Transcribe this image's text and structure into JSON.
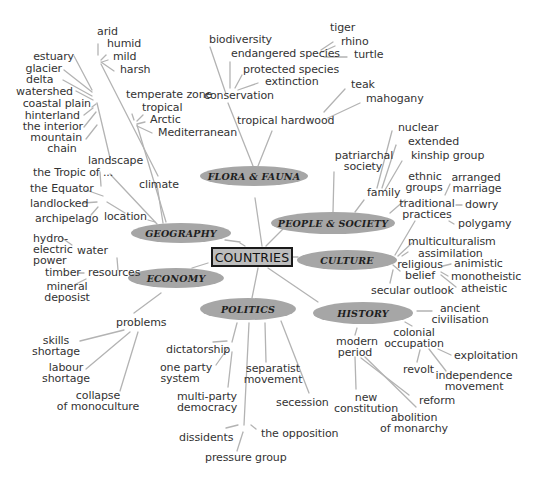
{
  "diagram": {
    "type": "mind-map",
    "center": "COUNTRIES",
    "colors": {
      "oval_fill": "#a6a6a6",
      "center_fill": "#bdbdbd",
      "center_border": "#1a1a1a",
      "connector": "#b3b3b3",
      "text": "#333333"
    },
    "branches": {
      "flora_fauna": {
        "label": "FLORA & FAUNA",
        "conservation": "conservation",
        "biodiversity": "biodiversity",
        "endangered_species": "endangered species",
        "tiger": "tiger",
        "rhino": "rhino",
        "turtle": "turtle",
        "protected_species": "protected species",
        "extinction": "extinction",
        "tropical_hardwood": "tropical hardwood",
        "teak": "teak",
        "mahogany": "mahogany"
      },
      "geography": {
        "label": "GEOGRAPHY",
        "climate": "climate",
        "arid": "arid",
        "humid": "humid",
        "mild": "mild",
        "harsh": "harsh",
        "temperate_zone": "temperate zone",
        "tropical": "tropical",
        "arctic": "Arctic",
        "mediterranean": "Mediterranean",
        "landscape": "landscape",
        "estuary": "estuary",
        "glacier": "glacier",
        "delta": "delta",
        "watershed": "watershed",
        "coastal_plain": "coastal plain",
        "hinterland": "hinterland",
        "the_interior": "the interior",
        "mountain_chain_1": "mountain",
        "mountain_chain_2": "chain",
        "location": "location",
        "tropic_of": "the Tropic of ...",
        "equator": "the Equator",
        "landlocked": "landlocked",
        "archipelago": "archipelago"
      },
      "people_society": {
        "label": "PEOPLE & SOCIETY",
        "patriarchal_1": "patriarchal",
        "patriarchal_2": "society",
        "family": "family",
        "nuclear": "nuclear",
        "extended": "extended",
        "kinship_group": "kinship group",
        "ethnic_1": "ethnic",
        "ethnic_2": "groups"
      },
      "culture": {
        "label": "CULTURE",
        "traditional_1": "traditional",
        "traditional_2": "practices",
        "arranged_1": "arranged",
        "arranged_2": "marriage",
        "dowry": "dowry",
        "polygamy": "polygamy",
        "multiculturalism": "multiculturalism",
        "assimilation": "assimilation",
        "religious_1": "religious",
        "religious_2": "belief",
        "animistic": "animistic",
        "monotheistic": "monotheistic",
        "atheistic": "atheistic",
        "secular_outlook": "secular outlook"
      },
      "economy": {
        "label": "ECONOMY",
        "resources": "resources",
        "water": "water",
        "hydro_1": "hydro-",
        "hydro_2": "electric",
        "hydro_3": "power",
        "timber": "timber",
        "mineral_1": "mineral",
        "mineral_2": "deposist",
        "problems": "problems",
        "skills_1": "skills",
        "skills_2": "shortage",
        "labour_1": "labour",
        "labour_2": "shortage",
        "collapse_1": "collapse",
        "collapse_2": "of monoculture"
      },
      "politics": {
        "label": "POLITICS",
        "dictatorship": "dictatorship",
        "one_party_1": "one party",
        "one_party_2": "system",
        "multi_party_1": "multi-party",
        "multi_party_2": "democracy",
        "separatist_1": "separatist",
        "separatist_2": "movement",
        "secession": "secession",
        "dissidents": "dissidents",
        "the_opposition": "the opposition",
        "pressure_group": "pressure group"
      },
      "history": {
        "label": "HISTORY",
        "ancient_1": "ancient",
        "ancient_2": "civilisation",
        "colonial_1": "colonial",
        "colonial_2": "occupation",
        "exploitation": "exploitation",
        "revolt": "revolt",
        "independence_1": "independence",
        "independence_2": "movement",
        "modern_1": "modern",
        "modern_2": "period",
        "new_constitution_1": "new",
        "new_constitution_2": "constitution",
        "reform": "reform",
        "abolition_1": "abolition",
        "abolition_2": "of monarchy"
      }
    }
  }
}
